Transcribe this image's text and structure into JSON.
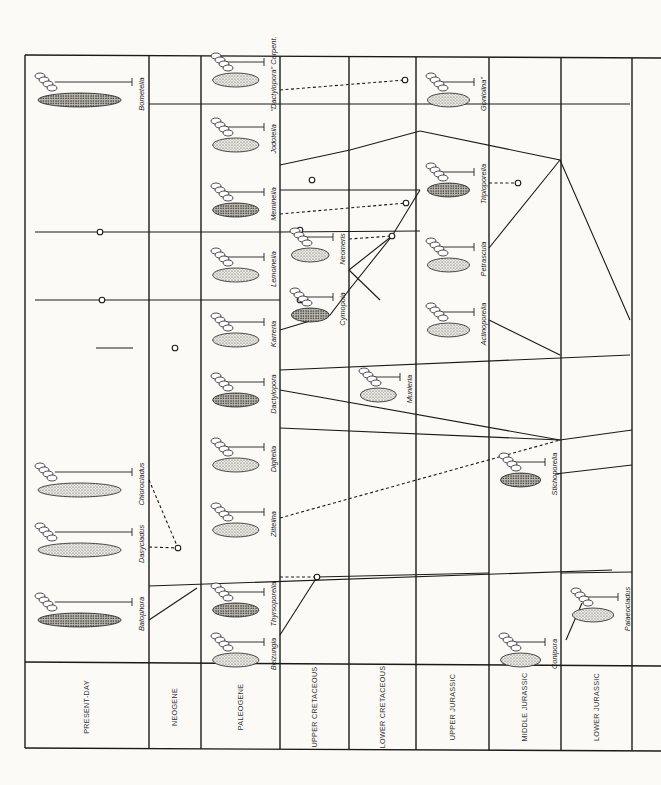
{
  "diagram": {
    "orientation": "rotated-90-clockwise",
    "frame": {
      "left": 25,
      "right": 661,
      "top": 55,
      "label_separator": 662,
      "bottom": 748
    },
    "periods": [
      {
        "label": "PRESENT-DAY",
        "x0": 25,
        "x1": 149
      },
      {
        "label": "NEOGENE",
        "x0": 149,
        "x1": 201
      },
      {
        "label": "PALEOGENE",
        "x0": 201,
        "x1": 280
      },
      {
        "label": "UPPER CRETACEOUS",
        "x0": 280,
        "x1": 349
      },
      {
        "label": "LOWER CRETACEOUS",
        "x0": 349,
        "x1": 416
      },
      {
        "label": "UPPER JURASSIC",
        "x0": 416,
        "x1": 489
      },
      {
        "label": "MIDDLE JURASSIC",
        "x0": 489,
        "x1": 561
      },
      {
        "label": "LOWER JURASSIC",
        "x0": 561,
        "x1": 632
      },
      {
        "label": "",
        "x0": 632,
        "x1": 661
      }
    ],
    "taxa": [
      {
        "name": "Bornetella",
        "period": "PRESENT-DAY",
        "x": 144,
        "y": 90
      },
      {
        "name": "Chlorocladus",
        "period": "PRESENT-DAY",
        "x": 144,
        "y": 480
      },
      {
        "name": "Dasycladus",
        "period": "PRESENT-DAY",
        "x": 144,
        "y": 540
      },
      {
        "name": "Batophora",
        "period": "PRESENT-DAY",
        "x": 144,
        "y": 610
      },
      {
        "name": "\"Dactylopora\" Carpent.",
        "period": "PALEOGENE",
        "x": 276,
        "y": 70
      },
      {
        "name": "Jodotella",
        "period": "PALEOGENE",
        "x": 276,
        "y": 135
      },
      {
        "name": "Meminella",
        "period": "PALEOGENE",
        "x": 276,
        "y": 200
      },
      {
        "name": "Lemoinella",
        "period": "PALEOGENE",
        "x": 276,
        "y": 265
      },
      {
        "name": "Karreria",
        "period": "PALEOGENE",
        "x": 276,
        "y": 330
      },
      {
        "name": "Dactylopora",
        "period": "PALEOGENE",
        "x": 276,
        "y": 390
      },
      {
        "name": "Digitella",
        "period": "PALEOGENE",
        "x": 276,
        "y": 455
      },
      {
        "name": "Zittelina",
        "period": "PALEOGENE",
        "x": 276,
        "y": 520
      },
      {
        "name": "Thyrsoporella",
        "period": "PALEOGENE",
        "x": 276,
        "y": 600
      },
      {
        "name": "Belzungia",
        "period": "PALEOGENE",
        "x": 276,
        "y": 650
      },
      {
        "name": "Neomeris",
        "period": "UPPER CRETACEOUS",
        "x": 345,
        "y": 245
      },
      {
        "name": "Cymopoia",
        "period": "UPPER CRETACEOUS",
        "x": 345,
        "y": 305
      },
      {
        "name": "Munieria",
        "period": "LOWER CRETACEOUS",
        "x": 412,
        "y": 385
      },
      {
        "name": "Goniolina\"",
        "period": "UPPER JURASSIC",
        "x": 486,
        "y": 90
      },
      {
        "name": "Triploporella",
        "period": "UPPER JURASSIC",
        "x": 486,
        "y": 180
      },
      {
        "name": "Petrascula",
        "period": "UPPER JURASSIC",
        "x": 486,
        "y": 255
      },
      {
        "name": "Actinoporella",
        "period": "UPPER JURASSIC",
        "x": 486,
        "y": 320
      },
      {
        "name": "Stichoporella",
        "period": "MIDDLE JURASSIC",
        "x": 557,
        "y": 470
      },
      {
        "name": "Palaeocladus",
        "period": "LOWER JURASSIC",
        "x": 630,
        "y": 605
      },
      {
        "name": "Conipora",
        "period": "MIDDLE JURASSIC",
        "x": 557,
        "y": 650
      }
    ],
    "links_solid": [
      [
        [
          149,
          104
        ],
        [
          420,
          104
        ]
      ],
      [
        [
          420,
          104
        ],
        [
          630,
          104
        ]
      ],
      [
        [
          35,
          232
        ],
        [
          280,
          232
        ],
        [
          420,
          231
        ]
      ],
      [
        [
          35,
          300
        ],
        [
          280,
          300
        ]
      ],
      [
        [
          96,
          348
        ],
        [
          133,
          348
        ]
      ],
      [
        [
          280,
          370
        ],
        [
          630,
          355
        ]
      ],
      [
        [
          149,
          586
        ],
        [
          612,
          570
        ]
      ],
      [
        [
          420,
          131
        ],
        [
          350,
          150
        ],
        [
          280,
          165
        ]
      ],
      [
        [
          420,
          131
        ],
        [
          560,
          160
        ],
        [
          630,
          320
        ]
      ],
      [
        [
          420,
          190
        ],
        [
          280,
          190
        ]
      ],
      [
        [
          420,
          190
        ],
        [
          392,
          236
        ],
        [
          349,
          290
        ],
        [
          330,
          315
        ],
        [
          280,
          330
        ]
      ],
      [
        [
          392,
          236
        ],
        [
          349,
          270
        ]
      ],
      [
        [
          380,
          300
        ],
        [
          349,
          270
        ]
      ],
      [
        [
          560,
          160
        ],
        [
          489,
          248
        ]
      ],
      [
        [
          489,
          320
        ],
        [
          560,
          355
        ]
      ],
      [
        [
          280,
          390
        ],
        [
          560,
          440
        ]
      ],
      [
        [
          560,
          440
        ],
        [
          632,
          430
        ]
      ],
      [
        [
          555,
          474
        ],
        [
          632,
          465
        ]
      ],
      [
        [
          280,
          428
        ],
        [
          560,
          440
        ]
      ],
      [
        [
          149,
          620
        ],
        [
          197,
          588
        ]
      ],
      [
        [
          317,
          577
        ],
        [
          280,
          635
        ]
      ],
      [
        [
          317,
          577
        ],
        [
          489,
          573
        ]
      ],
      [
        [
          561,
          573
        ],
        [
          632,
          572
        ]
      ],
      [
        [
          582,
          603
        ],
        [
          566,
          640
        ]
      ]
    ],
    "links_dashed": [
      [
        [
          280,
          90
        ],
        [
          405,
          80
        ]
      ],
      [
        [
          280,
          214
        ],
        [
          406,
          203
        ]
      ],
      [
        [
          349,
          239
        ],
        [
          392,
          236
        ]
      ],
      [
        [
          489,
          183
        ],
        [
          518,
          183
        ]
      ],
      [
        [
          149,
          547
        ],
        [
          178,
          548
        ]
      ],
      [
        [
          149,
          480
        ],
        [
          178,
          548
        ]
      ],
      [
        [
          280,
          518
        ],
        [
          560,
          440
        ]
      ],
      [
        [
          280,
          577
        ],
        [
          317,
          577
        ]
      ]
    ],
    "nodes": [
      [
        405,
        80
      ],
      [
        406,
        203
      ],
      [
        392,
        236
      ],
      [
        518,
        183
      ],
      [
        178,
        548
      ],
      [
        317,
        577
      ],
      [
        100,
        232
      ],
      [
        102,
        300
      ],
      [
        175,
        348
      ],
      [
        312,
        180
      ],
      [
        300,
        230
      ],
      [
        300,
        300
      ]
    ]
  }
}
